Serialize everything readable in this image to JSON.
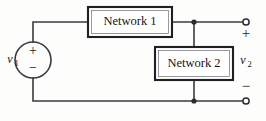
{
  "diagram": {
    "blocks": [
      {
        "id": "network1",
        "label": "Network 1"
      },
      {
        "id": "network2",
        "label": "Network 2"
      }
    ],
    "source": {
      "label": "v",
      "subscript": "1",
      "plus": "+",
      "minus": "−"
    },
    "output": {
      "label": "v",
      "subscript": "2",
      "plus": "+",
      "minus": "−"
    },
    "colors": {
      "wire": "#3a3a42",
      "box_border": "#1f1f26",
      "text": "#14141a",
      "background": "#fdfdfc",
      "node": "#2b2b33"
    }
  }
}
